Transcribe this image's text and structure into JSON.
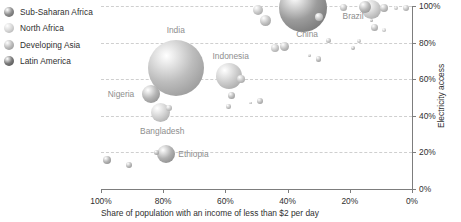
{
  "legend": {
    "items": [
      {
        "label": "Sub-Saharan Africa",
        "color": "#8e8e8e"
      },
      {
        "label": "North Africa",
        "color": "#d9d9d9"
      },
      {
        "label": "Developing Asia",
        "color": "#bdbdbd"
      },
      {
        "label": "Latin America",
        "color": "#7a7a7a"
      }
    ]
  },
  "chart_data": {
    "type": "scatter",
    "title": "",
    "xlabel": "Share of population with an income of less than $2 per day",
    "ylabel": "Electricity access",
    "xlim": [
      100,
      0
    ],
    "ylim": [
      0,
      100
    ],
    "x_ticks": [
      "100%",
      "80%",
      "60%",
      "40%",
      "20%",
      "0%"
    ],
    "x_tick_values": [
      100,
      80,
      60,
      40,
      20,
      0
    ],
    "y_ticks": [
      "0%",
      "20%",
      "40%",
      "60%",
      "80%",
      "100%"
    ],
    "y_tick_values": [
      0,
      20,
      40,
      60,
      80,
      100
    ],
    "grid": "horizontal-dotted",
    "legend_position": "top-left-outside",
    "size_encoding": "population",
    "points": [
      {
        "label": "India",
        "x": 76,
        "y": 66,
        "r": 28,
        "group": "Developing Asia",
        "color": "#bdbdbd",
        "label_dx": 0,
        "label_dy": -38
      },
      {
        "label": "China",
        "x": 35,
        "y": 99,
        "r": 24,
        "group": "Developing Asia",
        "color": "#9c9c9c",
        "label_dx": 4,
        "label_dy": 26
      },
      {
        "label": "Indonesia",
        "x": 59,
        "y": 62,
        "r": 13,
        "group": "Developing Asia",
        "color": "#cdcdcd",
        "label_dx": 2,
        "label_dy": -20
      },
      {
        "label": "Nigeria",
        "x": 84,
        "y": 52,
        "r": 9,
        "group": "Sub-Saharan Africa",
        "color": "#b5b5b5",
        "label_dx": -30,
        "label_dy": 0
      },
      {
        "label": "Bangladesh",
        "x": 81,
        "y": 42,
        "r": 9.5,
        "group": "Developing Asia",
        "color": "#d2d2d2",
        "label_dx": 2,
        "label_dy": 19
      },
      {
        "label": "Ethiopia",
        "x": 79,
        "y": 19,
        "r": 9,
        "group": "Sub-Saharan Africa",
        "color": "#b0b0b0",
        "label_dx": 27,
        "label_dy": 0
      },
      {
        "label": "Brazil",
        "x": 13,
        "y": 98,
        "r": 9.5,
        "group": "Latin America",
        "color": "#cfcfcf",
        "label_dx": -22,
        "label_dy": 6
      },
      {
        "label": "",
        "x": 49.5,
        "y": 98,
        "r": 5,
        "group": "Developing Asia",
        "color": "#c9c9c9"
      },
      {
        "label": "",
        "x": 47,
        "y": 92,
        "r": 5.5,
        "group": "Sub-Saharan Africa",
        "color": "#c4c4c4"
      },
      {
        "label": "",
        "x": 30,
        "y": 94,
        "r": 4,
        "group": "Developing Asia",
        "color": "#cacaca"
      },
      {
        "label": "",
        "x": 22,
        "y": 99,
        "r": 3.5,
        "group": "Latin America",
        "color": "#c7c7c7"
      },
      {
        "label": "",
        "x": 15,
        "y": 99.5,
        "r": 6,
        "group": "Latin America",
        "color": "#b9b9b9"
      },
      {
        "label": "",
        "x": 9,
        "y": 99,
        "r": 4,
        "group": "Latin America",
        "color": "#c2c2c2"
      },
      {
        "label": "",
        "x": 5,
        "y": 99,
        "r": 2,
        "group": "Latin America",
        "color": "#cfcfcf"
      },
      {
        "label": "",
        "x": 2,
        "y": 99,
        "r": 3,
        "group": "Latin America",
        "color": "#c6c6c6"
      },
      {
        "label": "",
        "x": 12,
        "y": 88,
        "r": 3.5,
        "group": "Latin America",
        "color": "#c3c3c3"
      },
      {
        "label": "",
        "x": 9,
        "y": 87,
        "r": 1.8,
        "group": "North Africa",
        "color": "#d5d5d5"
      },
      {
        "label": "",
        "x": 13,
        "y": 92,
        "r": 1.5,
        "group": "Latin America",
        "color": "#bdbdbd"
      },
      {
        "label": "",
        "x": 17,
        "y": 81,
        "r": 2.2,
        "group": "North Africa",
        "color": "#cbcbcb"
      },
      {
        "label": "",
        "x": 19,
        "y": 77,
        "r": 2.2,
        "group": "Sub-Saharan Africa",
        "color": "#c0c0c0"
      },
      {
        "label": "",
        "x": 27,
        "y": 81,
        "r": 2.5,
        "group": "Developing Asia",
        "color": "#c6c6c6"
      },
      {
        "label": "",
        "x": 33,
        "y": 73,
        "r": 1.6,
        "group": "Sub-Saharan Africa",
        "color": "#c4c4c4"
      },
      {
        "label": "",
        "x": 30,
        "y": 71,
        "r": 2.6,
        "group": "Developing Asia",
        "color": "#c1c1c1"
      },
      {
        "label": "",
        "x": 41,
        "y": 78,
        "r": 4.5,
        "group": "Developing Asia",
        "color": "#c3c3c3"
      },
      {
        "label": "",
        "x": 44,
        "y": 77,
        "r": 4,
        "group": "North Africa",
        "color": "#cccccc"
      },
      {
        "label": "",
        "x": 55,
        "y": 60,
        "r": 4,
        "group": "Developing Asia",
        "color": "#c7c7c7"
      },
      {
        "label": "",
        "x": 58,
        "y": 51,
        "r": 3.5,
        "group": "Sub-Saharan Africa",
        "color": "#bdbdbd"
      },
      {
        "label": "",
        "x": 59,
        "y": 45,
        "r": 2.2,
        "group": "Sub-Saharan Africa",
        "color": "#c5c5c5"
      },
      {
        "label": "",
        "x": 49,
        "y": 48,
        "r": 3,
        "group": "Sub-Saharan Africa",
        "color": "#bfbfbf"
      },
      {
        "label": "",
        "x": 52,
        "y": 47,
        "r": 1.4,
        "group": "Sub-Saharan Africa",
        "color": "#c8c8c8"
      },
      {
        "label": "",
        "x": 78,
        "y": 44,
        "r": 3,
        "group": "Developing Asia",
        "color": "#c9c9c9"
      },
      {
        "label": "",
        "x": 82,
        "y": 20,
        "r": 2.5,
        "group": "Sub-Saharan Africa",
        "color": "#bcbcbc"
      },
      {
        "label": "",
        "x": 98,
        "y": 16,
        "r": 4,
        "group": "Sub-Saharan Africa",
        "color": "#b4b4b4"
      },
      {
        "label": "",
        "x": 91,
        "y": 13,
        "r": 3,
        "group": "Sub-Saharan Africa",
        "color": "#bababa"
      }
    ]
  }
}
